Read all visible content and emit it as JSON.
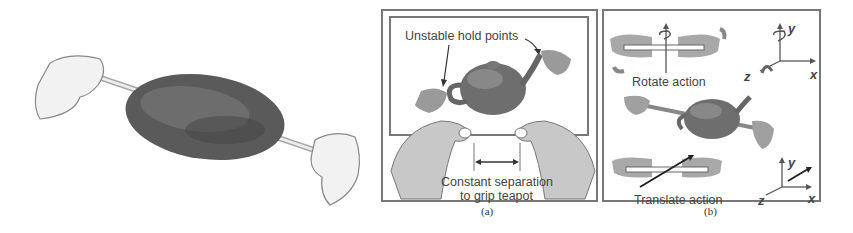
{
  "figure": {
    "left_illustration": {
      "description": "Two hands gripping a skewer through a roast (rotisserie metaphor)"
    },
    "panel_a": {
      "caption": "(a)",
      "labels": {
        "hold_points": "Unstable hold points",
        "separation_line1": "Constant separation",
        "separation_line2": "to grip teapot"
      }
    },
    "panel_b": {
      "caption": "(b)",
      "labels": {
        "rotate": "Rotate action",
        "translate": "Translate action"
      },
      "axes_top": {
        "x": "x",
        "y": "y",
        "z": "z"
      },
      "axes_bottom": {
        "x": "x",
        "y": "y",
        "z": "z"
      }
    }
  },
  "colors": {
    "border": "#777777",
    "hand_fill": "#b8b8b8",
    "teapot": "#6e6e6e",
    "text": "#444444"
  }
}
